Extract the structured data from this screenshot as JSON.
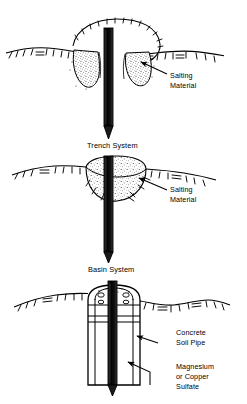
{
  "figure": {
    "background_color": "#ffffff",
    "ink_color": "#000000",
    "width": 247,
    "height": 404
  },
  "panels": [
    {
      "id": "trench",
      "caption": "Trench System",
      "labels": [
        {
          "id": "salting-material",
          "line1": "Salting",
          "line2": "Material"
        }
      ]
    },
    {
      "id": "basin",
      "caption": "Basin System",
      "labels": [
        {
          "id": "salting-material",
          "line1": "Salting",
          "line2": "Material"
        }
      ]
    },
    {
      "id": "soil-pipe",
      "caption": "",
      "labels": [
        {
          "id": "concrete-soil-pipe",
          "line1": "Concrete",
          "line2": "Soil Pipe"
        },
        {
          "id": "magnesium-or-copper-sulfate",
          "line1": "Magnesium",
          "line2": "or Copper",
          "line3": "Sulfate"
        }
      ]
    }
  ]
}
